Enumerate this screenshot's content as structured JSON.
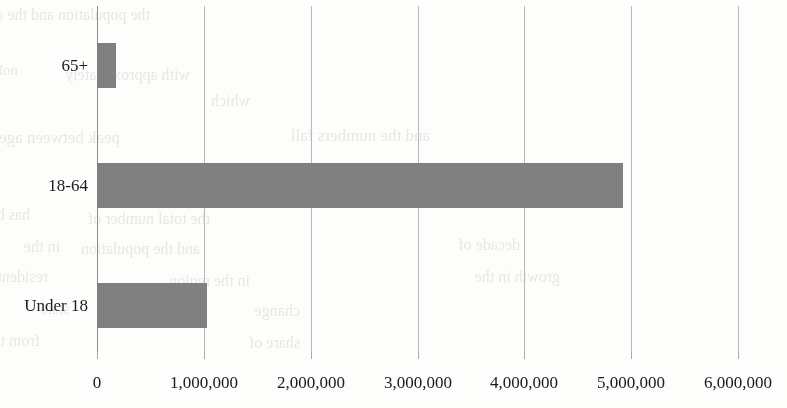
{
  "chart_data": {
    "type": "bar",
    "orientation": "horizontal",
    "title": "",
    "xlabel": "",
    "ylabel": "",
    "categories": [
      "Under 18",
      "18-64",
      "65+"
    ],
    "values": [
      1030000,
      4925000,
      175000
    ],
    "xlim": [
      0,
      6000000
    ],
    "xticks": [
      0,
      1000000,
      2000000,
      3000000,
      4000000,
      5000000,
      6000000
    ],
    "xtick_labels": [
      "0",
      "1,000,000",
      "2,000,000",
      "3,000,000",
      "4,000,000",
      "5,000,000",
      "6,000,000"
    ],
    "grid": true,
    "grid_axis": "x",
    "legend": false,
    "bar_color": "#808080",
    "gridline_color": "#b9b9b9",
    "axis_color": "#8d8d8d",
    "text_color": "#1b1b1b",
    "background_color": "#fdfdfc"
  },
  "background_bleed": {
    "description": "faint mirrored show-through text from the reverse of the scanned page",
    "lines": [
      {
        "text": "the population and the age",
        "x": 150,
        "y": 6,
        "size": 16
      },
      {
        "text": "nolitaluqoq",
        "x": 18,
        "y": 62,
        "size": 15
      },
      {
        "text": "with approximately",
        "x": 190,
        "y": 66,
        "size": 16
      },
      {
        "text": "which",
        "x": 250,
        "y": 92,
        "size": 16
      },
      {
        "text": "peak between ages",
        "x": 120,
        "y": 128,
        "size": 17
      },
      {
        "text": "and the numbers fall",
        "x": 430,
        "y": 126,
        "size": 17
      },
      {
        "text": "has been",
        "x": 30,
        "y": 206,
        "size": 16
      },
      {
        "text": "the total number of",
        "x": 210,
        "y": 210,
        "size": 16
      },
      {
        "text": "in the",
        "x": 60,
        "y": 238,
        "size": 16
      },
      {
        "text": "and the population",
        "x": 200,
        "y": 240,
        "size": 16
      },
      {
        "text": "decade of",
        "x": 520,
        "y": 236,
        "size": 16
      },
      {
        "text": "residents",
        "x": 48,
        "y": 268,
        "size": 16
      },
      {
        "text": "in the region",
        "x": 250,
        "y": 272,
        "size": 16
      },
      {
        "text": "growth in the",
        "x": 560,
        "y": 268,
        "size": 16
      },
      {
        "text": "state",
        "x": 70,
        "y": 300,
        "size": 16
      },
      {
        "text": "change",
        "x": 300,
        "y": 302,
        "size": 16
      },
      {
        "text": "from the",
        "x": 40,
        "y": 332,
        "size": 16
      },
      {
        "text": "share of",
        "x": 300,
        "y": 334,
        "size": 16
      }
    ]
  }
}
